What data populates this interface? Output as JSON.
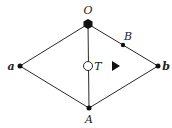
{
  "diagram": {
    "colors": {
      "edge": "#2a2a2a",
      "node": "#111111",
      "background": "#ffffff"
    },
    "nodes": [
      {
        "id": "O",
        "label": "O",
        "shape": "hexagon",
        "x": 88,
        "y": 24,
        "label_x": 88,
        "label_y": 15
      },
      {
        "id": "B",
        "label": "B",
        "shape": "dot",
        "x": 123,
        "y": 45,
        "label_x": 128,
        "label_y": 39
      },
      {
        "id": "a",
        "label": "a",
        "shape": "dot",
        "x": 20,
        "y": 66,
        "label_x": 11,
        "label_y": 70
      },
      {
        "id": "b",
        "label": "b",
        "shape": "dot",
        "x": 158,
        "y": 66,
        "label_x": 166,
        "label_y": 70
      },
      {
        "id": "A",
        "label": "A",
        "shape": "dot",
        "x": 89,
        "y": 108,
        "label_x": 89,
        "label_y": 123
      },
      {
        "id": "T",
        "label": "T",
        "shape": "open-circle",
        "x": 88,
        "y": 66,
        "label_x": 98,
        "label_y": 70
      }
    ],
    "edges": [
      {
        "from": "O",
        "to": "a"
      },
      {
        "from": "O",
        "to": "b"
      },
      {
        "from": "a",
        "to": "A"
      },
      {
        "from": "b",
        "to": "A"
      },
      {
        "from": "O",
        "to": "A"
      }
    ],
    "markers": [
      {
        "id": "direction-arrow",
        "shape": "filled-triangle-right",
        "x": 115,
        "y": 66
      }
    ]
  }
}
